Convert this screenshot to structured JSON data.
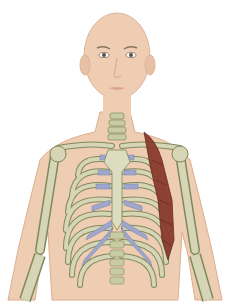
{
  "illustration": {
    "subject": "anterior thorax skeleton with head",
    "colors": {
      "background": "#ffffff",
      "skin": "#efcdb3",
      "skin_shadow": "#e2b598",
      "bone": "#d6d5b5",
      "bone_outline": "#7f8a5c",
      "cartilage": "#9ea6cc",
      "muscle": "#8a3b2e",
      "eye": "#5a5040",
      "brow": "#8a7560"
    },
    "highlighted_structure": "muscle along left lateral rib cage"
  }
}
